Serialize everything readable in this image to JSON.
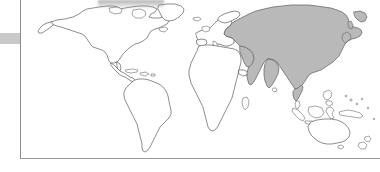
{
  "figure": {
    "kind": "world-outline-map",
    "caption": "",
    "frame": {
      "left_rule": true,
      "bottom_rule": true,
      "top_rule": false,
      "right_rule": false,
      "rule_color": "#8d8d8d"
    },
    "margin_bar": {
      "label": "",
      "color": "#c9c9c9"
    }
  },
  "map": {
    "projection": "equirectangular",
    "outline_color": "#5d5d5d",
    "land_fill": "#ffffff",
    "highlight_fill": "#b9b9b9",
    "ocean_fill": "#ffffff",
    "highlighted_regions": [
      "Asia"
    ],
    "regions": [
      {
        "name": "North America",
        "highlighted": false
      },
      {
        "name": "Greenland",
        "highlighted": false
      },
      {
        "name": "Central America",
        "highlighted": false
      },
      {
        "name": "South America",
        "highlighted": false
      },
      {
        "name": "Europe",
        "highlighted": false
      },
      {
        "name": "Africa",
        "highlighted": false
      },
      {
        "name": "Asia",
        "highlighted": true
      },
      {
        "name": "Southeast Asian Islands",
        "highlighted": false
      },
      {
        "name": "Australia",
        "highlighted": false
      },
      {
        "name": "New Zealand",
        "highlighted": false
      }
    ]
  }
}
